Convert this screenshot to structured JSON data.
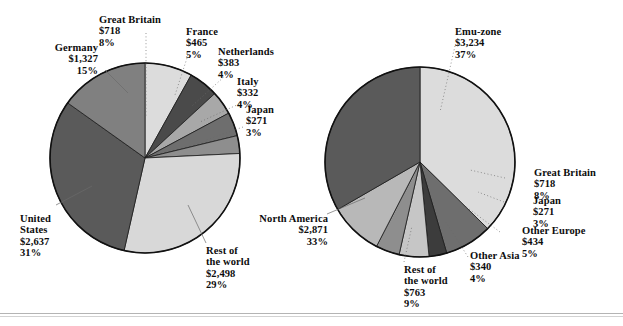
{
  "figure": {
    "background_color": "#ffffff",
    "outline_color": "#111111",
    "rule_color": "#b4b4b4"
  },
  "chart_data": [
    {
      "type": "pie",
      "title": "",
      "id": "left-pie",
      "unit": "$ billions",
      "center": [
        145,
        158
      ],
      "radius": 95,
      "start_angle_deg": 0,
      "direction": "clockwise",
      "categories": [
        "Great Britain",
        "France",
        "Netherlands",
        "Italy",
        "Japan",
        "Rest of the world",
        "United States",
        "Germany"
      ],
      "values": [
        718,
        465,
        383,
        332,
        271,
        2498,
        2637,
        1327
      ],
      "percents": [
        8,
        5,
        4,
        4,
        3,
        29,
        31,
        15
      ],
      "colors": [
        "#dcdcdc",
        "#4a4a4a",
        "#a8a8a8",
        "#6e6e6e",
        "#8e8e8e",
        "#d8d8d8",
        "#5a5a5a",
        "#808080"
      ],
      "legend": "callout-labels"
    },
    {
      "type": "pie",
      "title": "",
      "id": "right-pie",
      "unit": "$ billions",
      "center": [
        420,
        162
      ],
      "radius": 95,
      "start_angle_deg": 0,
      "direction": "clockwise",
      "categories": [
        "Emu-zone",
        "Great Britain",
        "Japan",
        "Other Europe",
        "Other Asia",
        "Rest of the world",
        "North America"
      ],
      "values": [
        3234,
        718,
        271,
        434,
        340,
        763,
        2871
      ],
      "percents": [
        37,
        8,
        3,
        5,
        4,
        9,
        33
      ],
      "colors": [
        "#dcdcdc",
        "#6e6e6e",
        "#3c3c3c",
        "#c6c6c6",
        "#8e8e8e",
        "#b8b8b8",
        "#5a5a5a"
      ],
      "legend": "callout-labels"
    }
  ],
  "left_labels": [
    {
      "name": "Germany",
      "value": "$1,327",
      "percent": "15%"
    },
    {
      "name": "Great Britain",
      "value": "$718",
      "percent": "8%"
    },
    {
      "name": "France",
      "value": "$465",
      "percent": "5%"
    },
    {
      "name": "Netherlands",
      "value": "$383",
      "percent": "4%"
    },
    {
      "name": "Italy",
      "value": "$332",
      "percent": "4%"
    },
    {
      "name": "Japan",
      "value": "$271",
      "percent": "3%"
    },
    {
      "name": "United States",
      "value": "$2,637",
      "percent": "31%"
    },
    {
      "name": "Rest of",
      "name2": "the world",
      "value": "$2,498",
      "percent": "29%"
    }
  ],
  "right_labels": [
    {
      "name": "Emu-zone",
      "value": "$3,234",
      "percent": "37%"
    },
    {
      "name": "Great Britain",
      "value": "$718",
      "percent": "8%"
    },
    {
      "name": "Japan",
      "value": "$271",
      "percent": "3%"
    },
    {
      "name": "Other Europe",
      "value": "$434",
      "percent": "5%"
    },
    {
      "name": "Other Asia",
      "value": "$340",
      "percent": "4%"
    },
    {
      "name": "Rest of",
      "name2": "the world",
      "value": "$763",
      "percent": "9%"
    },
    {
      "name": "North America",
      "value": "$2,871",
      "percent": "33%"
    }
  ]
}
